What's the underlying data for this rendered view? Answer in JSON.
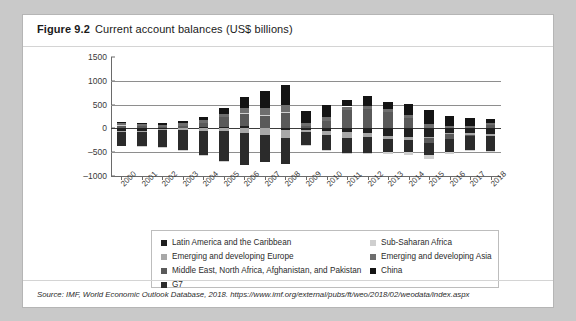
{
  "figure": {
    "number": "Figure 9.2",
    "title": "Current account balances (US$ billions)",
    "source": "Source: IMF, World Economic Outlook Database, 2018. https://www.imf.org/external/pubs/ft/weo/2018/02/weodata/index.aspx"
  },
  "colors": {
    "latin_america": "#1f1f1f",
    "emerging_europe": "#a8a8a8",
    "middle_east": "#5a5a5a",
    "g7": "#2b2b2b",
    "sub_saharan": "#cfcfcf",
    "emerging_asia": "#6e6e6e",
    "china": "#141414",
    "gridline": "#8e8e8e",
    "axis": "#6a6a6a",
    "card_bg": "#ffffff",
    "page_bg": "#c9c9c9"
  },
  "legend": {
    "left_column": [
      {
        "label": "Latin America and the Caribbean",
        "swatch": "#1f1f1f"
      },
      {
        "label": "Emerging and developing Europe",
        "swatch": "#a8a8a8"
      },
      {
        "label": "Middle East, North Africa, Afghanistan, and Pakistan",
        "swatch": "#5a5a5a"
      },
      {
        "label": "G7",
        "swatch": "#2b2b2b"
      }
    ],
    "right_column": [
      {
        "label": "Sub-Saharan Africa",
        "swatch": "#cfcfcf"
      },
      {
        "label": "Emerging and developing Asia",
        "swatch": "#6e6e6e"
      },
      {
        "label": "China",
        "swatch": "#141414"
      }
    ]
  },
  "chart_data": {
    "type": "bar",
    "stacked": true,
    "title": "Current account balances (US$ billions)",
    "xlabel": "",
    "ylabel": "",
    "ylim": [
      -1000,
      1500
    ],
    "yticks": [
      1500,
      1000,
      500,
      0,
      -500,
      -1000
    ],
    "grid": true,
    "legend_position": "bottom",
    "categories": [
      "2000",
      "2001",
      "2002",
      "2003",
      "2004",
      "2005",
      "2006",
      "2007",
      "2008",
      "2009",
      "2010",
      "2011",
      "2012",
      "2013",
      "2014",
      "2015",
      "2016",
      "2017",
      "2018"
    ],
    "series": [
      {
        "name": "Latin America and the Caribbean",
        "color": "#1f1f1f",
        "values": [
          -48,
          -54,
          -16,
          8,
          21,
          35,
          48,
          15,
          -39,
          -30,
          -62,
          -78,
          -100,
          -160,
          -182,
          -172,
          -97,
          -90,
          -110
        ]
      },
      {
        "name": "Emerging and developing Europe",
        "color": "#a8a8a8",
        "values": [
          -32,
          -20,
          -24,
          -37,
          -60,
          -62,
          -92,
          -136,
          -156,
          -48,
          -82,
          -115,
          -80,
          -72,
          -60,
          -20,
          -26,
          -40,
          -55
        ]
      },
      {
        "name": "Middle East, North Africa, Afghanistan, and Pakistan",
        "color": "#5a5a5a",
        "values": [
          70,
          46,
          28,
          50,
          92,
          196,
          255,
          254,
          342,
          42,
          160,
          380,
          412,
          350,
          210,
          -110,
          -95,
          -28,
          70
        ]
      },
      {
        "name": "G7",
        "color": "#2b2b2b",
        "values": [
          -290,
          -290,
          -350,
          -420,
          -500,
          -630,
          -680,
          -580,
          -560,
          -270,
          -300,
          -320,
          -330,
          -260,
          -250,
          -260,
          -270,
          -290,
          -300
        ]
      },
      {
        "name": "Sub-Saharan Africa",
        "color": "#cfcfcf",
        "values": [
          4,
          -6,
          -12,
          -12,
          -6,
          -2,
          20,
          8,
          10,
          -28,
          -12,
          -16,
          -36,
          -40,
          -60,
          -80,
          -55,
          -30,
          -22
        ]
      },
      {
        "name": "Emerging and developing Asia",
        "color": "#6e6e6e",
        "values": [
          44,
          40,
          52,
          58,
          66,
          76,
          100,
          150,
          130,
          80,
          86,
          80,
          60,
          52,
          74,
          100,
          60,
          50,
          40
        ]
      },
      {
        "name": "China",
        "color": "#141414",
        "values": [
          21,
          17,
          35,
          43,
          69,
          132,
          232,
          353,
          421,
          243,
          238,
          136,
          215,
          148,
          236,
          293,
          202,
          165,
          80
        ]
      }
    ]
  }
}
